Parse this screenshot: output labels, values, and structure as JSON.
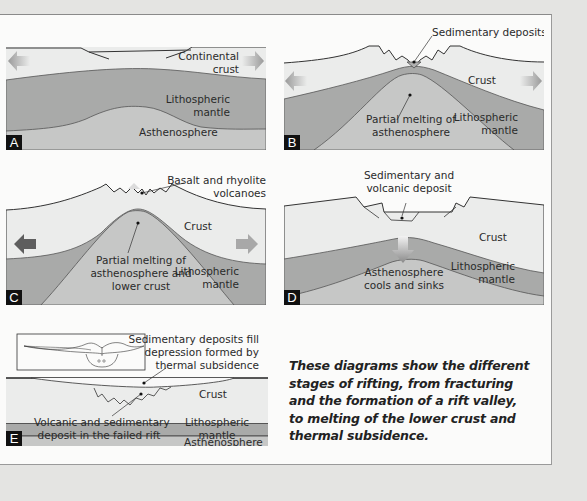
{
  "colors": {
    "crust": "#ebeceb",
    "lithospheric_mantle": "#a9aaa9",
    "asthenosphere": "#c6c7c6",
    "background": "#e4e4e2",
    "sheet": "#fbfbfa",
    "arrow_light": "#a8a8a8",
    "arrow_dark": "#5e5e5e"
  },
  "panels": {
    "A": {
      "badge": "A",
      "labels": {
        "continental_crust_1": "Continental",
        "continental_crust_2": "crust",
        "lithospheric_mantle_1": "Lithospheric",
        "lithospheric_mantle_2": "mantle",
        "asthenosphere": "Asthenosphere"
      }
    },
    "B": {
      "badge": "B",
      "labels": {
        "sedimentary_deposits": "Sedimentary deposits",
        "crust": "Crust",
        "partial_melting_1": "Partial melting of",
        "partial_melting_2": "asthenosphere",
        "lithospheric_mantle_1": "Lithospheric",
        "lithospheric_mantle_2": "mantle"
      }
    },
    "C": {
      "badge": "C",
      "labels": {
        "volcanoes_1": "Basalt and rhyolite",
        "volcanoes_2": "volcanoes",
        "crust": "Crust",
        "partial_melting_1": "Partial melting of",
        "partial_melting_2": "asthenosphere and",
        "partial_melting_3": "lower crust",
        "lithospheric_mantle_1": "Lithospheric",
        "lithospheric_mantle_2": "mantle"
      }
    },
    "D": {
      "badge": "D",
      "labels": {
        "deposit_1": "Sedimentary and",
        "deposit_2": "volcanic deposit",
        "crust": "Crust",
        "cools_1": "Asthenosphere",
        "cools_2": "cools and sinks",
        "lithospheric_mantle_1": "Lithospheric",
        "lithospheric_mantle_2": "mantle"
      }
    },
    "E": {
      "badge": "E",
      "labels": {
        "fill_1": "Sedimentary deposits fill",
        "fill_2": "depression formed by",
        "fill_3": "thermal subsidence",
        "crust": "Crust",
        "failed_rift_1": "Volcanic and sedimentary",
        "failed_rift_2": "deposit in the failed rift",
        "lithospheric_mantle_1": "Lithospheric",
        "lithospheric_mantle_2": "mantle",
        "asthenosphere": "Asthenosphere"
      }
    }
  },
  "caption": {
    "line1": "These diagrams show the different",
    "line2": "stages of rifting, from fracturing",
    "line3": "and the formation of a rift valley,",
    "line4": "to melting of the lower crust and",
    "line5": "thermal subsidence."
  }
}
